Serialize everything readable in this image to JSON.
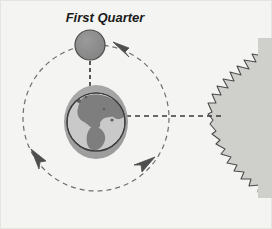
{
  "figure": {
    "kind": "astronomy-diagram",
    "title": "First Quarter",
    "width": 272,
    "height": 229,
    "background_color": "#f4f4f2",
    "border_color": "#e2e2de"
  },
  "labels": {
    "title": "First Quarter"
  },
  "bodies": {
    "moon": {
      "name": "Moon",
      "phase": "First Quarter",
      "cx": 90,
      "cy": 45,
      "r": 15,
      "fill_color": "#8d8d8d",
      "stroke_color": "#4a4a4a"
    },
    "earth": {
      "name": "Earth",
      "cx": 96,
      "cy": 122,
      "rx": 32,
      "ry": 37,
      "halo_color": "#a3a3a3",
      "ocean_color": "#c9c9c9",
      "land_color": "#7e7e7e",
      "outline_color": "#3f3f3f"
    },
    "sun": {
      "name": "Sun",
      "cx": 286,
      "cy": 114,
      "r": 76,
      "fill_color": "#cfcfcb",
      "ray_stroke_color": "#454545",
      "clipped": true
    }
  },
  "orbit": {
    "name": "Moon orbit around Earth",
    "cx": 96,
    "cy": 118,
    "r": 73,
    "style": "dashed",
    "stroke_color": "#6f6f6f",
    "direction": "counterclockwise",
    "arrow_count": 3
  },
  "sight_lines": [
    {
      "name": "moon-to-earth-line",
      "style": "dashed",
      "from": "Moon",
      "to": "Earth",
      "orientation": "vertical",
      "stroke_color": "#3a3a3a"
    },
    {
      "name": "earth-to-sun-line",
      "style": "dashed",
      "from": "Earth",
      "to": "Sun",
      "orientation": "horizontal",
      "stroke_color": "#3a3a3a"
    }
  ]
}
